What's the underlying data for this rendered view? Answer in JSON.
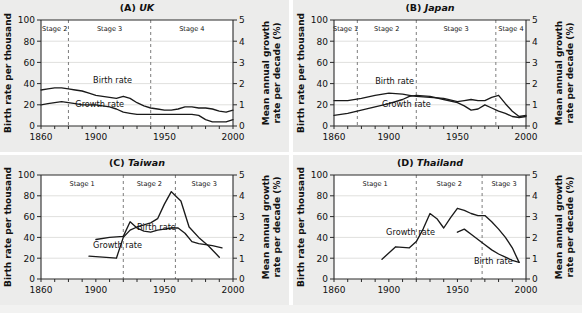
{
  "figure": {
    "background_color": "#e8e8e6",
    "panel_background": "#ececeb",
    "line_color": "#1a1a1a",
    "divider_color": "#7c7c7c"
  },
  "axes": {
    "left_label": "Birth rate per thousand",
    "right_label_line1": "Mean annual growth",
    "right_label_line2": "rate per decade (%)",
    "left_ticks": [
      "0",
      "20",
      "40",
      "60",
      "80",
      "100"
    ],
    "right_ticks": [
      "0",
      "1",
      "2",
      "3",
      "4",
      "5"
    ],
    "x_ticks": [
      "1860",
      "1900",
      "1950",
      "2000"
    ],
    "xlim": [
      1860,
      2000
    ],
    "ylim_left": [
      0,
      100
    ],
    "ylim_right": [
      0,
      5
    ],
    "x_minor_tick_step": 10,
    "grid": "horizontal gridlines at 20, 40, 60, 80"
  },
  "series_labels": {
    "birth": "Birth rate",
    "growth": "Growth rate"
  },
  "chart_data": [
    {
      "id": "A",
      "type": "line",
      "panel_prefix": "(A)",
      "title": "UK",
      "xlabel": "",
      "ylabel": "Birth rate per thousand",
      "ylabel_right": "Mean annual growth rate per decade (%)",
      "xlim": [
        1860,
        2000
      ],
      "ylim": [
        0,
        100
      ],
      "ylim_right": [
        0,
        5
      ],
      "stages": [
        {
          "label": "Stage 2",
          "start": 1860,
          "end": 1880
        },
        {
          "label": "Stage 3",
          "start": 1880,
          "end": 1940
        },
        {
          "label": "Stage 4",
          "start": 1940,
          "end": 2000
        }
      ],
      "dividers": [
        1880,
        1940
      ],
      "series": [
        {
          "name": "Birth rate",
          "axis": "left",
          "label_x": 1898,
          "label_y": 41,
          "x": [
            1860,
            1865,
            1870,
            1875,
            1880,
            1885,
            1890,
            1895,
            1900,
            1905,
            1910,
            1915,
            1920,
            1925,
            1930,
            1935,
            1940,
            1945,
            1950,
            1955,
            1960,
            1965,
            1970,
            1975,
            1980,
            1985,
            1990,
            1995,
            2000
          ],
          "values": [
            34,
            35,
            36,
            36,
            35,
            34,
            33,
            31,
            29,
            28,
            27,
            26,
            28,
            26,
            22,
            19,
            17,
            16,
            15,
            15,
            16,
            18,
            18,
            17,
            17,
            16,
            14,
            13,
            15
          ]
        },
        {
          "name": "Growth rate",
          "axis": "right",
          "label_x": 1885,
          "label_y": 18,
          "x": [
            1860,
            1865,
            1870,
            1875,
            1880,
            1885,
            1890,
            1895,
            1900,
            1905,
            1910,
            1915,
            1920,
            1925,
            1930,
            1935,
            1940,
            1945,
            1950,
            1955,
            1960,
            1965,
            1970,
            1975,
            1980,
            1985,
            1990,
            1995,
            2000
          ],
          "values": [
            20,
            21,
            22,
            23,
            22,
            21,
            20,
            20,
            20,
            19,
            18,
            16,
            13,
            12,
            11,
            11,
            11,
            11,
            11,
            11,
            11,
            11,
            11,
            10,
            6,
            4,
            4,
            4,
            6
          ]
        }
      ]
    },
    {
      "id": "B",
      "type": "line",
      "panel_prefix": "(B)",
      "title": "Japan",
      "xlabel": "",
      "ylabel": "Birth rate per thousand",
      "ylabel_right": "Mean annual growth rate per decade (%)",
      "xlim": [
        1860,
        2000
      ],
      "ylim": [
        0,
        100
      ],
      "ylim_right": [
        0,
        5
      ],
      "stages": [
        {
          "label": "Stage 1",
          "start": 1860,
          "end": 1877
        },
        {
          "label": "Stage 2",
          "start": 1877,
          "end": 1920
        },
        {
          "label": "Stage 3",
          "start": 1920,
          "end": 1978
        },
        {
          "label": "Stage 4",
          "start": 1978,
          "end": 2000
        }
      ],
      "dividers": [
        1877,
        1920,
        1978
      ],
      "series": [
        {
          "name": "Birth rate",
          "axis": "left",
          "label_x": 1890,
          "label_y": 40,
          "x": [
            1860,
            1870,
            1880,
            1890,
            1900,
            1910,
            1915,
            1920,
            1930,
            1940,
            1950,
            1955,
            1960,
            1965,
            1970,
            1975,
            1980,
            1985,
            1990,
            1995,
            2000
          ],
          "values": [
            24,
            24,
            26,
            29,
            31,
            30,
            29,
            28,
            27,
            26,
            23,
            24,
            25,
            24,
            24,
            27,
            29,
            21,
            14,
            9,
            10
          ]
        },
        {
          "name": "Growth rate",
          "axis": "right",
          "label_x": 1895,
          "label_y": 18,
          "x": [
            1860,
            1870,
            1880,
            1890,
            1900,
            1910,
            1915,
            1920,
            1930,
            1940,
            1950,
            1955,
            1960,
            1965,
            1970,
            1975,
            1980,
            1985,
            1990,
            1995,
            2000
          ],
          "values": [
            10,
            12,
            15,
            18,
            21,
            25,
            28,
            29,
            28,
            25,
            22,
            19,
            15,
            16,
            20,
            17,
            14,
            12,
            9,
            8,
            9
          ]
        }
      ]
    },
    {
      "id": "C",
      "type": "line",
      "panel_prefix": "(C)",
      "title": "Taiwan",
      "xlabel": "",
      "ylabel": "Birth rate per thousand",
      "ylabel_right": "Mean annual growth rate per decade (%)",
      "xlim": [
        1860,
        2000
      ],
      "ylim": [
        0,
        100
      ],
      "ylim_right": [
        0,
        5
      ],
      "stages": [
        {
          "label": "Stage 1",
          "start": 1860,
          "end": 1920
        },
        {
          "label": "Stage 2",
          "start": 1920,
          "end": 1958
        },
        {
          "label": "Stage 3",
          "start": 1958,
          "end": 2000
        }
      ],
      "dividers": [
        1920,
        1958
      ],
      "series": [
        {
          "name": "Birth rate",
          "axis": "left",
          "label_x": 1930,
          "label_y": 47,
          "x": [
            1900,
            1910,
            1920,
            1925,
            1930,
            1935,
            1940,
            1945,
            1950,
            1955,
            1960,
            1965,
            1970,
            1975,
            1980,
            1985,
            1992
          ],
          "values": [
            38,
            40,
            41,
            55,
            49,
            46,
            45,
            47,
            48,
            49,
            49,
            44,
            36,
            34,
            33,
            32,
            30
          ]
        },
        {
          "name": "Growth rate",
          "axis": "right",
          "label_x": 1898,
          "label_y": 30,
          "x": [
            1895,
            1905,
            1915,
            1920,
            1925,
            1930,
            1935,
            1940,
            1945,
            1950,
            1955,
            1958,
            1962,
            1968,
            1975,
            1982,
            1990
          ],
          "values": [
            22,
            21,
            20,
            40,
            47,
            50,
            52,
            54,
            58,
            72,
            84,
            80,
            75,
            50,
            40,
            32,
            21
          ]
        }
      ]
    },
    {
      "id": "D",
      "type": "line",
      "panel_prefix": "(D)",
      "title": "Thailand",
      "xlabel": "",
      "ylabel": "Birth rate per thousand",
      "ylabel_right": "Mean annual growth rate per decade (%)",
      "xlim": [
        1860,
        2000
      ],
      "ylim": [
        0,
        100
      ],
      "ylim_right": [
        0,
        5
      ],
      "stages": [
        {
          "label": "Stage 1",
          "start": 1860,
          "end": 1920
        },
        {
          "label": "Stage 2",
          "start": 1920,
          "end": 1968
        },
        {
          "label": "Stage 3",
          "start": 1968,
          "end": 2000
        }
      ],
      "dividers": [
        1920,
        1968
      ],
      "series": [
        {
          "name": "Birth rate",
          "axis": "left",
          "label_x": 1962,
          "label_y": 14,
          "x": [
            1950,
            1955,
            1960,
            1965,
            1970,
            1975,
            1980,
            1985,
            1990,
            1995
          ],
          "values": [
            45,
            48,
            43,
            38,
            33,
            28,
            24,
            21,
            18,
            16
          ]
        },
        {
          "name": "Growth rate",
          "axis": "right",
          "label_x": 1898,
          "label_y": 42,
          "x": [
            1895,
            1905,
            1915,
            1920,
            1925,
            1930,
            1935,
            1940,
            1945,
            1950,
            1955,
            1960,
            1965,
            1970,
            1975,
            1980,
            1985,
            1990,
            1995
          ],
          "values": [
            19,
            31,
            30,
            36,
            48,
            63,
            58,
            49,
            59,
            68,
            66,
            63,
            61,
            61,
            55,
            48,
            40,
            30,
            16
          ]
        }
      ]
    }
  ]
}
